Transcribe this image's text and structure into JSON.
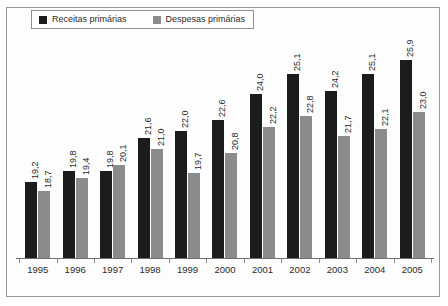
{
  "chart_data": {
    "type": "bar",
    "title": "",
    "subtitle": "",
    "xlabel": "",
    "ylabel": "",
    "grid": false,
    "legend_position": "top-left",
    "categories": [
      "1995",
      "1996",
      "1997",
      "1998",
      "1999",
      "2000",
      "2001",
      "2002",
      "2003",
      "2004",
      "2005"
    ],
    "series": [
      {
        "name": "Receitas primárias",
        "color": "#1c1c1c",
        "values": [
          19.2,
          19.8,
          19.8,
          21.6,
          22.0,
          22.6,
          24.0,
          25.1,
          24.2,
          25.1,
          25.9
        ],
        "labels": [
          "19,2",
          "19,8",
          "19,8",
          "21,6",
          "22,0",
          "22,6",
          "24,0",
          "25,1",
          "24,2",
          "25,1",
          "25,9"
        ]
      },
      {
        "name": "Despesas primárias",
        "color": "#8b8b8b",
        "values": [
          18.7,
          19.4,
          20.1,
          21.0,
          19.7,
          20.8,
          22.2,
          22.8,
          21.7,
          22.1,
          23.0
        ],
        "labels": [
          "18,7",
          "19,4",
          "20,1",
          "21,0",
          "19,7",
          "20,8",
          "22,2",
          "22,8",
          "21,7",
          "22,1",
          "23,0"
        ]
      }
    ],
    "ylim": [
      15.0,
      27.2
    ],
    "value_axis_visible": false
  },
  "legend": {
    "items": [
      {
        "label": "Receitas primárias",
        "color": "#1c1c1c"
      },
      {
        "label": "Despesas primárias",
        "color": "#8b8b8b"
      }
    ]
  }
}
